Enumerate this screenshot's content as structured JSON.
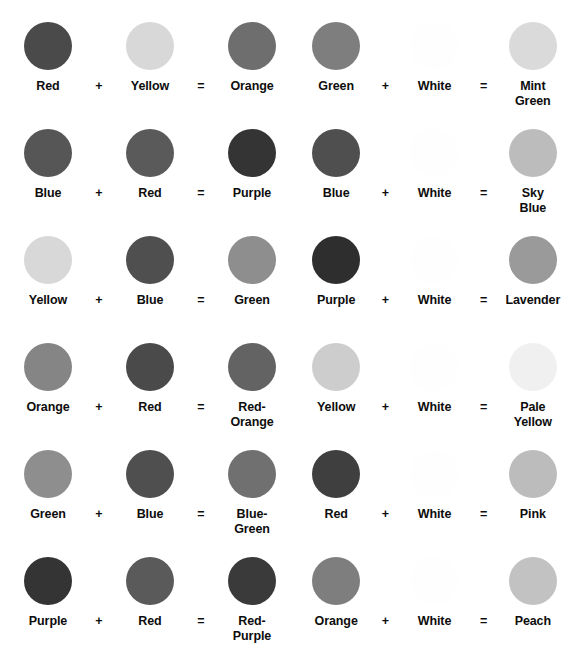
{
  "operators": {
    "plus": "+",
    "equals": "="
  },
  "palette": {
    "red": "#4a4a4a",
    "red_light": "#5a5a5a",
    "yellow": "#d8d8d8",
    "yellow_mid": "#cdcdcd",
    "orange": "#6e6e6e",
    "orange_light": "#858585",
    "blue": "#565656",
    "blue_dark": "#4f4f4f",
    "purple": "#343434",
    "purple_dark": "#2e2e2e",
    "green": "#8e8e8e",
    "green_mid": "#7e7e7e",
    "white": "#fefefe",
    "mint_green": "#dadada",
    "sky_blue": "#bcbcbc",
    "lavender": "#9a9a9a",
    "pale_yellow": "#f0f0f0",
    "pink": "#bcbcbc",
    "peach": "#c2c2c2",
    "red_orange": "#636363",
    "blue_green": "#707070",
    "red_purple": "#3a3a3a"
  },
  "columns": [
    {
      "name": "primary-mixes",
      "equations": [
        {
          "id": "red-plus-yellow",
          "terms": [
            {
              "label": "Red",
              "color": "#4a4a4a"
            },
            {
              "label": "Yellow",
              "color": "#d8d8d8"
            },
            {
              "label": "Orange",
              "color": "#6e6e6e"
            }
          ]
        },
        {
          "id": "blue-plus-red",
          "terms": [
            {
              "label": "Blue",
              "color": "#565656"
            },
            {
              "label": "Red",
              "color": "#5a5a5a"
            },
            {
              "label": "Purple",
              "color": "#343434"
            }
          ]
        },
        {
          "id": "yellow-plus-blue",
          "terms": [
            {
              "label": "Yellow",
              "color": "#d8d8d8"
            },
            {
              "label": "Blue",
              "color": "#4f4f4f"
            },
            {
              "label": "Green",
              "color": "#8e8e8e"
            }
          ]
        },
        {
          "id": "orange-plus-red",
          "terms": [
            {
              "label": "Orange",
              "color": "#858585"
            },
            {
              "label": "Red",
              "color": "#4a4a4a"
            },
            {
              "label": "Red-\nOrange",
              "color": "#636363"
            }
          ]
        },
        {
          "id": "green-plus-blue",
          "terms": [
            {
              "label": "Green",
              "color": "#8e8e8e"
            },
            {
              "label": "Blue",
              "color": "#4f4f4f"
            },
            {
              "label": "Blue-\nGreen",
              "color": "#707070"
            }
          ]
        },
        {
          "id": "purple-plus-red",
          "terms": [
            {
              "label": "Purple",
              "color": "#343434"
            },
            {
              "label": "Red",
              "color": "#5a5a5a"
            },
            {
              "label": "Red-\nPurple",
              "color": "#3a3a3a"
            }
          ]
        }
      ]
    },
    {
      "name": "tint-mixes",
      "equations": [
        {
          "id": "green-plus-white",
          "terms": [
            {
              "label": "Green",
              "color": "#7e7e7e"
            },
            {
              "label": "White",
              "color": "#fefefe"
            },
            {
              "label": "Mint\nGreen",
              "color": "#dadada"
            }
          ]
        },
        {
          "id": "blue-plus-white",
          "terms": [
            {
              "label": "Blue",
              "color": "#4f4f4f"
            },
            {
              "label": "White",
              "color": "#fefefe"
            },
            {
              "label": "Sky\nBlue",
              "color": "#bcbcbc"
            }
          ]
        },
        {
          "id": "purple-plus-white",
          "terms": [
            {
              "label": "Purple",
              "color": "#2e2e2e"
            },
            {
              "label": "White",
              "color": "#fefefe"
            },
            {
              "label": "Lavender",
              "color": "#9a9a9a"
            }
          ]
        },
        {
          "id": "yellow-plus-white",
          "terms": [
            {
              "label": "Yellow",
              "color": "#cdcdcd"
            },
            {
              "label": "White",
              "color": "#fefefe"
            },
            {
              "label": "Pale\nYellow",
              "color": "#f0f0f0"
            }
          ]
        },
        {
          "id": "red-plus-white",
          "terms": [
            {
              "label": "Red",
              "color": "#3f3f3f"
            },
            {
              "label": "White",
              "color": "#fefefe"
            },
            {
              "label": "Pink",
              "color": "#bcbcbc"
            }
          ]
        },
        {
          "id": "orange-plus-white",
          "terms": [
            {
              "label": "Orange",
              "color": "#7e7e7e"
            },
            {
              "label": "White",
              "color": "#fefefe"
            },
            {
              "label": "Peach",
              "color": "#c2c2c2"
            }
          ]
        }
      ]
    }
  ]
}
